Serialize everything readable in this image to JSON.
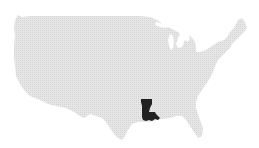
{
  "map": {
    "region": "United States",
    "highlighted_state": "Louisiana",
    "colors": {
      "background": "#ffffff",
      "land": "#e3e3e3",
      "land_dot": "#d2d2d2",
      "highlight": "#222222"
    }
  }
}
